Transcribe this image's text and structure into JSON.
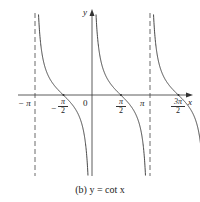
{
  "chart_data": {
    "type": "line",
    "title": "(b) y = cot x",
    "function": "y = cot x",
    "xlabel": "x",
    "ylabel": "y",
    "x_ticks": [
      "-π",
      "-π/2",
      "0",
      "π/2",
      "π",
      "3π/2"
    ],
    "asymptotes": [
      "x = -π",
      "x = 0",
      "x = π",
      "x = 2π"
    ],
    "zeros": [
      "-π/2",
      "π/2",
      "3π/2"
    ],
    "series": [
      {
        "name": "cot x",
        "x_range": [
          "-π",
          "2π"
        ],
        "branches": 3
      }
    ],
    "grid": false,
    "legend": null
  },
  "labels": {
    "y_axis": "y",
    "x_axis": "x",
    "origin": "0",
    "neg_pi": "− π",
    "pi": "π",
    "neg_half_pi_sign": "−",
    "half_pi_num": "π",
    "half_pi_den": "2",
    "three_half_pi_num": "3π",
    "three_half_pi_den": "2",
    "caption": "(b) y = cot x"
  }
}
